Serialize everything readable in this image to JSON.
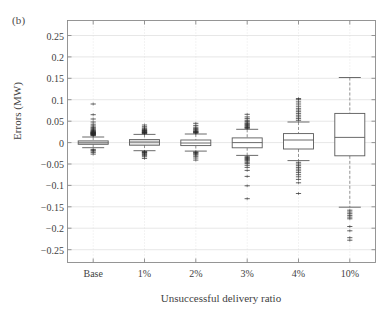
{
  "panel": {
    "tag": "(b)"
  },
  "chart_data": {
    "type": "box",
    "title": "",
    "panel_label": "(b)",
    "xlabel": "Unsuccessful delivery ratio",
    "ylabel": "Errors (MW)",
    "categories": [
      "Base",
      "1%",
      "2%",
      "3%",
      "4%",
      "10%"
    ],
    "ylim": [
      -0.28,
      0.285
    ],
    "yticks": [
      0.25,
      0.2,
      0.15,
      0.1,
      0.05,
      0,
      -0.05,
      -0.1,
      -0.15,
      -0.2,
      -0.25
    ],
    "ytick_labels": [
      "0.25",
      "0.2",
      "0.15",
      "0.1",
      "0.05",
      "0",
      "−0.05",
      "−0.1",
      "−0.15",
      "−0.2",
      "−0.25"
    ],
    "grid": true,
    "grid_color": "#dcdcdc",
    "box_edge_color": "#5a5a5a",
    "box_fill_color": "#ffffff",
    "median_color": "#5a5a5a",
    "whisker_color": "#7a7a7a",
    "outlier_color": "#2b2b2b",
    "legend": null,
    "boxes": [
      {
        "category": "Base",
        "q1": -0.004,
        "median": -0.0005,
        "q3": 0.004,
        "whisker_low": -0.012,
        "whisker_high": 0.013,
        "fill": "#e9e9e9",
        "outliers_high": [
          0.016,
          0.017,
          0.018,
          0.019,
          0.019,
          0.02,
          0.021,
          0.021,
          0.022,
          0.022,
          0.023,
          0.023,
          0.024,
          0.025,
          0.026,
          0.027,
          0.028,
          0.03,
          0.032,
          0.034,
          0.036,
          0.039,
          0.043,
          0.048,
          0.055,
          0.065,
          0.09
        ],
        "outliers_low": [
          -0.016,
          -0.018,
          -0.02,
          -0.023,
          -0.027
        ]
      },
      {
        "category": "1%",
        "q1": -0.006,
        "median": 0.001,
        "q3": 0.007,
        "whisker_low": -0.019,
        "whisker_high": 0.019,
        "fill": "#e2e2e2",
        "outliers_high": [
          0.021,
          0.022,
          0.023,
          0.023,
          0.024,
          0.025,
          0.026,
          0.027,
          0.028,
          0.029,
          0.03,
          0.032,
          0.034,
          0.037,
          0.041
        ],
        "outliers_low": [
          -0.021,
          -0.022,
          -0.023,
          -0.024,
          -0.026,
          -0.028,
          -0.03,
          -0.033,
          -0.037
        ]
      },
      {
        "category": "2%",
        "q1": -0.007,
        "median": -0.001,
        "q3": 0.006,
        "whisker_low": -0.02,
        "whisker_high": 0.02,
        "fill": "#ffffff",
        "outliers_high": [
          0.022,
          0.023,
          0.024,
          0.025,
          0.026,
          0.027,
          0.029,
          0.031,
          0.033,
          0.036,
          0.04,
          0.045
        ],
        "outliers_low": [
          -0.022,
          -0.023,
          -0.025,
          -0.027,
          -0.029,
          -0.032,
          -0.036,
          -0.041
        ]
      },
      {
        "category": "3%",
        "q1": -0.012,
        "median": 0.0,
        "q3": 0.011,
        "whisker_low": -0.03,
        "whisker_high": 0.031,
        "fill": "#ffffff",
        "outliers_high": [
          0.033,
          0.035,
          0.036,
          0.038,
          0.04,
          0.042,
          0.044,
          0.046,
          0.049,
          0.052,
          0.056,
          0.06,
          0.066
        ],
        "outliers_low": [
          -0.033,
          -0.035,
          -0.037,
          -0.039,
          -0.041,
          -0.043,
          -0.046,
          -0.049,
          -0.053,
          -0.058,
          -0.065,
          -0.079,
          -0.101,
          -0.131
        ]
      },
      {
        "category": "4%",
        "q1": -0.015,
        "median": 0.006,
        "q3": 0.021,
        "whisker_low": -0.042,
        "whisker_high": 0.048,
        "fill": "#ffffff",
        "outliers_high": [
          0.052,
          0.056,
          0.06,
          0.064,
          0.068,
          0.072,
          0.076,
          0.08,
          0.085,
          0.09,
          0.095,
          0.1,
          0.103
        ],
        "outliers_low": [
          -0.046,
          -0.05,
          -0.054,
          -0.058,
          -0.062,
          -0.066,
          -0.07,
          -0.075,
          -0.08,
          -0.086,
          -0.094,
          -0.119
        ]
      },
      {
        "category": "10%",
        "q1": -0.031,
        "median": 0.012,
        "q3": 0.068,
        "whisker_low": -0.151,
        "whisker_high": 0.152,
        "fill": "#ffffff",
        "outliers_high": [],
        "outliers_low": [
          -0.158,
          -0.162,
          -0.166,
          -0.17,
          -0.174,
          -0.178,
          -0.196,
          -0.206,
          -0.222,
          -0.228
        ]
      }
    ]
  }
}
